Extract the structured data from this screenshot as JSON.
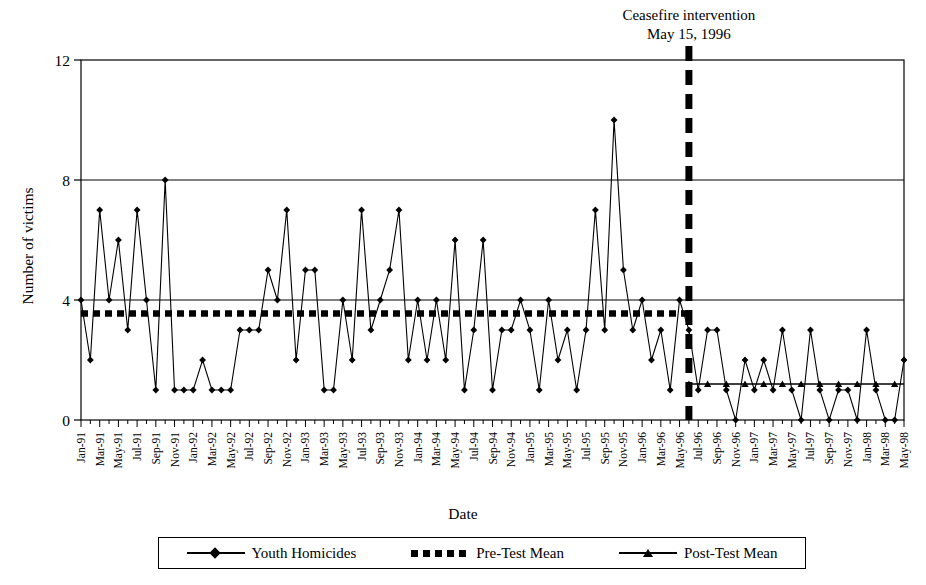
{
  "chart_data": {
    "type": "line",
    "title": "",
    "xlabel": "Date",
    "ylabel": "Number of victims",
    "ylim": [
      0,
      12
    ],
    "yticks": [
      0,
      4,
      8,
      12
    ],
    "grid": true,
    "legend_position": "bottom",
    "annotation": {
      "line1": "Ceasefire intervention",
      "line2": "May 15, 1996",
      "at_x": "1996-06",
      "style": "dashed-vertical"
    },
    "xtick_labels": [
      "Jan-91",
      "Mar-91",
      "May-91",
      "Jul-91",
      "Sep-91",
      "Nov-91",
      "Jan-92",
      "Mar-92",
      "May-92",
      "Jul-92",
      "Sep-92",
      "Nov-92",
      "Jan-93",
      "Mar-93",
      "May-93",
      "Jul-93",
      "Sep-93",
      "Nov-93",
      "Jan-94",
      "Mar-94",
      "May-94",
      "Jul-94",
      "Sep-94",
      "Nov-94",
      "Jan-95",
      "Mar-95",
      "May-95",
      "Jul-95",
      "Sep-95",
      "Nov-95",
      "Jan-96",
      "Mar-96",
      "May-96",
      "Jul-96",
      "Sep-96",
      "Nov-96",
      "Jan-97",
      "Mar-97",
      "May-97",
      "Jul-97",
      "Sep-97",
      "Nov-97",
      "Jan-98",
      "Mar-98",
      "May-98"
    ],
    "x_months": [
      "Jan-91",
      "Feb-91",
      "Mar-91",
      "Apr-91",
      "May-91",
      "Jun-91",
      "Jul-91",
      "Aug-91",
      "Sep-91",
      "Oct-91",
      "Nov-91",
      "Dec-91",
      "Jan-92",
      "Feb-92",
      "Mar-92",
      "Apr-92",
      "May-92",
      "Jun-92",
      "Jul-92",
      "Aug-92",
      "Sep-92",
      "Oct-92",
      "Nov-92",
      "Dec-92",
      "Jan-93",
      "Feb-93",
      "Mar-93",
      "Apr-93",
      "May-93",
      "Jun-93",
      "Jul-93",
      "Aug-93",
      "Sep-93",
      "Oct-93",
      "Nov-93",
      "Dec-93",
      "Jan-94",
      "Feb-94",
      "Mar-94",
      "Apr-94",
      "May-94",
      "Jun-94",
      "Jul-94",
      "Aug-94",
      "Sep-94",
      "Oct-94",
      "Nov-94",
      "Dec-94",
      "Jan-95",
      "Feb-95",
      "Mar-95",
      "Apr-95",
      "May-95",
      "Jun-95",
      "Jul-95",
      "Aug-95",
      "Sep-95",
      "Oct-95",
      "Nov-95",
      "Dec-95",
      "Jan-96",
      "Feb-96",
      "Mar-96",
      "Apr-96",
      "May-96",
      "Jun-96",
      "Jul-96",
      "Aug-96",
      "Sep-96",
      "Oct-96",
      "Nov-96",
      "Dec-96",
      "Jan-97",
      "Feb-97",
      "Mar-97",
      "Apr-97",
      "May-97",
      "Jun-97",
      "Jul-97",
      "Aug-97",
      "Sep-97",
      "Oct-97",
      "Nov-97",
      "Dec-97",
      "Jan-98",
      "Feb-98",
      "Mar-98",
      "Apr-98",
      "May-98"
    ],
    "series": [
      {
        "name": "Youth Homicides",
        "marker": "diamond",
        "values": [
          4,
          2,
          7,
          4,
          6,
          3,
          7,
          4,
          1,
          8,
          1,
          1,
          1,
          2,
          1,
          1,
          1,
          3,
          3,
          3,
          5,
          4,
          7,
          2,
          5,
          5,
          1,
          1,
          4,
          2,
          7,
          3,
          4,
          5,
          7,
          2,
          4,
          2,
          4,
          2,
          6,
          1,
          3,
          6,
          1,
          3,
          3,
          4,
          3,
          1,
          4,
          2,
          3,
          1,
          3,
          7,
          3,
          10,
          5,
          3,
          4,
          2,
          3,
          1,
          4,
          3,
          1,
          3,
          3,
          1,
          0,
          2,
          1,
          2,
          1,
          3,
          1,
          0,
          3,
          1,
          0,
          1,
          1,
          0,
          3,
          1,
          0,
          0,
          2
        ]
      },
      {
        "name": "Pre-Test Mean",
        "marker": "none",
        "line_style": "thick-dotted",
        "value": 3.55,
        "span": [
          "Jan-91",
          "Jun-96"
        ]
      },
      {
        "name": "Post-Test Mean",
        "marker": "triangle",
        "line_style": "solid",
        "value": 1.2,
        "span": [
          "Jun-96",
          "May-98"
        ]
      }
    ]
  },
  "legend": {
    "items": [
      {
        "label": "Youth Homicides",
        "marker": "diamond"
      },
      {
        "label": "Pre-Test Mean",
        "marker": "dotted"
      },
      {
        "label": "Post-Test Mean",
        "marker": "triangle"
      }
    ]
  }
}
